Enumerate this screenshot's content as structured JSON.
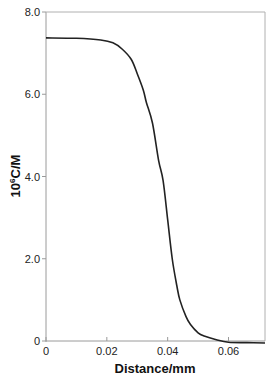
{
  "chart_data": {
    "type": "line",
    "title": "",
    "xlabel": "Distance/mm",
    "ylabel_parts": {
      "base": "10",
      "sup": "6",
      "rest": "C/M"
    },
    "ylabel": "10^6 C/M",
    "xlim": [
      0,
      0.072
    ],
    "ylim": [
      0,
      8.0
    ],
    "grid": false,
    "legend": "none",
    "x_ticks": [
      0,
      0.02,
      0.04,
      0.06
    ],
    "x_tick_labels": [
      "0",
      "0.02",
      "0.04",
      "0.06"
    ],
    "y_ticks": [
      0,
      2.0,
      4.0,
      6.0,
      8.0
    ],
    "y_tick_labels": [
      "0",
      "2.0",
      "4.0",
      "6.0",
      "8.0"
    ],
    "series": [
      {
        "name": "concentration profile",
        "color": "#222222",
        "x": [
          0,
          0.01,
          0.018,
          0.022,
          0.025,
          0.028,
          0.03,
          0.032,
          0.033,
          0.035,
          0.037,
          0.0385,
          0.04,
          0.0415,
          0.043,
          0.044,
          0.046,
          0.0475,
          0.05,
          0.052,
          0.056,
          0.06,
          0.066,
          0.072
        ],
        "y": [
          7.37,
          7.36,
          7.32,
          7.25,
          7.1,
          6.85,
          6.5,
          6.1,
          5.8,
          5.3,
          4.4,
          3.9,
          2.95,
          2.0,
          1.35,
          1.0,
          0.6,
          0.4,
          0.2,
          0.12,
          0.03,
          -0.03,
          -0.04,
          -0.05
        ]
      }
    ]
  }
}
